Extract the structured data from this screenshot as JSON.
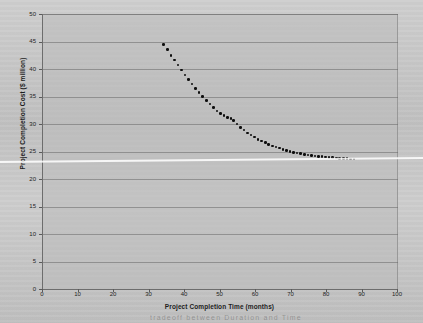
{
  "figure": {
    "background_color": "#c9c9c9",
    "plot_background_color": "#bcbcbc",
    "marker_color": "#0d0d0d",
    "axis_color": "#6d6d6d"
  },
  "chart_data": {
    "type": "scatter",
    "title": "",
    "xlabel": "Project Completion Time (months)",
    "ylabel": "Project Completion Cost ($ million)",
    "xlim": [
      0,
      100
    ],
    "ylim": [
      0,
      50
    ],
    "xticks": [
      0,
      10,
      20,
      30,
      40,
      50,
      60,
      70,
      80,
      90,
      100
    ],
    "yticks": [
      0,
      5,
      10,
      15,
      20,
      25,
      30,
      35,
      40,
      45,
      50
    ],
    "grid": "horizontal",
    "legend": "none",
    "series": [
      {
        "name": "Time-cost tradeoff curve",
        "marker": "filled-circle",
        "x": [
          34.0,
          35.0,
          36.0,
          37.0,
          38.0,
          39.0,
          40.0,
          41.0,
          42.0,
          43.0,
          44.0,
          45.0,
          46.0,
          47.0,
          48.0,
          49.0,
          50.0,
          51.0,
          52.0,
          53.0,
          53.6,
          54.6,
          55.6,
          56.6,
          57.6,
          58.6,
          59.6,
          60.6,
          61.6,
          62.6,
          63.6,
          64.6,
          65.6,
          66.6,
          67.6,
          68.6,
          69.6,
          70.6,
          71.6,
          72.6,
          73.6,
          74.6,
          75.6,
          76.6,
          77.6,
          78.6,
          79.6,
          80.6,
          81.6,
          82.6,
          83.6,
          84.6,
          85.6,
          86.6,
          87.6
        ],
        "y": [
          44.5,
          43.5,
          42.5,
          41.6,
          40.7,
          39.8,
          38.9,
          38.1,
          37.3,
          36.5,
          35.7,
          35.0,
          34.3,
          33.6,
          33.0,
          32.4,
          31.9,
          31.5,
          31.2,
          31.0,
          30.6,
          30.0,
          29.4,
          28.9,
          28.4,
          28.0,
          27.6,
          27.2,
          26.9,
          26.6,
          26.3,
          26.0,
          25.8,
          25.6,
          25.4,
          25.2,
          25.0,
          24.85,
          24.7,
          24.6,
          24.5,
          24.4,
          24.3,
          24.2,
          24.12,
          24.05,
          23.98,
          23.92,
          23.87,
          23.82,
          23.78,
          23.74,
          23.7,
          23.66,
          23.62
        ]
      }
    ]
  },
  "annotations": {
    "bottom_cut_text": "tradeoff between Duration and Time"
  }
}
